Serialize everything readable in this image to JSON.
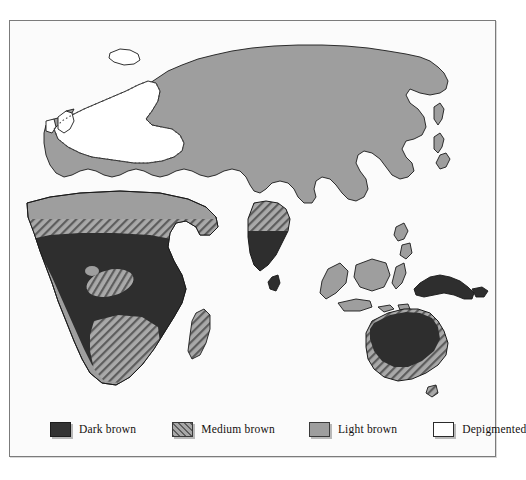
{
  "figure": {
    "kind": "thematic-world-map",
    "ocean_color": "#fbfbfb",
    "frame_color": "#7b7b7b"
  },
  "legend": {
    "items": [
      {
        "key": "dark",
        "label": "Dark brown",
        "swatch": "dark-brown-swatch",
        "fill": "#333333",
        "pattern": "solid"
      },
      {
        "key": "medium",
        "label": "Medium brown",
        "swatch": "medium-brown-swatch",
        "fill": "#9a9a9a",
        "pattern": "diagonal-hatch"
      },
      {
        "key": "light",
        "label": "Light brown",
        "swatch": "light-brown-swatch",
        "fill": "#9e9e9e",
        "pattern": "solid"
      },
      {
        "key": "white",
        "label": "Depigmented",
        "swatch": "depigmented-swatch",
        "fill": "#ffffff",
        "pattern": "solid"
      }
    ]
  },
  "map_regions": [
    {
      "name": "Northern Europe / Scandinavia",
      "class": "Depigmented"
    },
    {
      "name": "British Isles",
      "class": "Depigmented"
    },
    {
      "name": "Iceland",
      "class": "Depigmented"
    },
    {
      "name": "Western Russia",
      "class": "Depigmented"
    },
    {
      "name": "Southern Europe",
      "class": "Light brown"
    },
    {
      "name": "Siberia",
      "class": "Light brown"
    },
    {
      "name": "East Asia",
      "class": "Light brown"
    },
    {
      "name": "Japan",
      "class": "Light brown"
    },
    {
      "name": "Arabian Peninsula",
      "class": "Light brown"
    },
    {
      "name": "Central Asia",
      "class": "Light brown"
    },
    {
      "name": "Northern Africa",
      "class": "Light brown"
    },
    {
      "name": "Indonesia",
      "class": "Light brown"
    },
    {
      "name": "Philippines",
      "class": "Light brown"
    },
    {
      "name": "Sahel",
      "class": "Medium brown"
    },
    {
      "name": "Southern Africa",
      "class": "Medium brown"
    },
    {
      "name": "Congo Basin pocket",
      "class": "Medium brown"
    },
    {
      "name": "Madagascar",
      "class": "Medium brown"
    },
    {
      "name": "Central India",
      "class": "Medium brown"
    },
    {
      "name": "Southern Australia",
      "class": "Medium brown"
    },
    {
      "name": "Sub-Saharan Africa",
      "class": "Dark brown"
    },
    {
      "name": "Southern India",
      "class": "Dark brown"
    },
    {
      "name": "Sri Lanka",
      "class": "Dark brown"
    },
    {
      "name": "New Guinea",
      "class": "Dark brown"
    },
    {
      "name": "Australia",
      "class": "Dark brown"
    }
  ]
}
